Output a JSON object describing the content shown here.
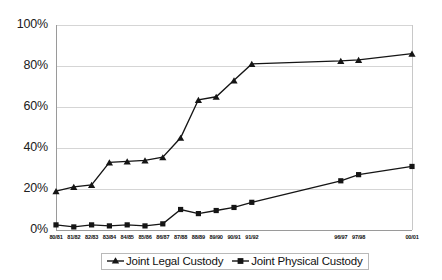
{
  "chart_data": {
    "type": "line",
    "title": "",
    "subtitle": "",
    "xlabel": "",
    "ylabel": "",
    "ylim": [
      0,
      100
    ],
    "ytick_values": [
      0,
      20,
      40,
      60,
      80,
      100
    ],
    "ytick_labels": [
      "0%",
      "20%",
      "40%",
      "60%",
      "80%",
      "100%"
    ],
    "grid": "horizontal",
    "legend_position": "bottom-center",
    "categories": [
      "80/81",
      "81/82",
      "82/83",
      "83/84",
      "84/85",
      "85/86",
      "86/87",
      "87/88",
      "88/89",
      "89/90",
      "90/91",
      "91/92",
      "96/97",
      "97/98",
      "00/01"
    ],
    "x_positions": [
      0,
      1,
      2,
      3,
      4,
      5,
      6,
      7,
      8,
      9,
      10,
      11,
      16,
      17,
      20
    ],
    "series": [
      {
        "name": "Joint Legal Custody",
        "marker": "triangle",
        "color": "#151515",
        "values": [
          19,
          21,
          22,
          33,
          33.5,
          34,
          35.5,
          45,
          63.5,
          65,
          73,
          81,
          82.5,
          83,
          86
        ]
      },
      {
        "name": "Joint Physical Custody",
        "marker": "square",
        "color": "#151515",
        "values": [
          2.5,
          1.5,
          2.5,
          2,
          2.5,
          2,
          3,
          10,
          8,
          9.5,
          11,
          13.5,
          24,
          27,
          31
        ]
      }
    ]
  },
  "axis": {
    "y_labels": [
      "100%",
      "80%",
      "60%",
      "40%",
      "20%",
      "0%"
    ],
    "x_labels": [
      "80/81",
      "81/82",
      "82/83",
      "83/84",
      "84/85",
      "85/86",
      "86/87",
      "87/88",
      "88/89",
      "89/90",
      "90/91",
      "91/92",
      "96/97",
      "97/98",
      "00/01"
    ]
  },
  "legend": {
    "items": [
      {
        "label": "Joint Legal Custody",
        "marker": "triangle-marker-icon"
      },
      {
        "label": "Joint Physical Custody",
        "marker": "square-marker-icon"
      }
    ]
  }
}
